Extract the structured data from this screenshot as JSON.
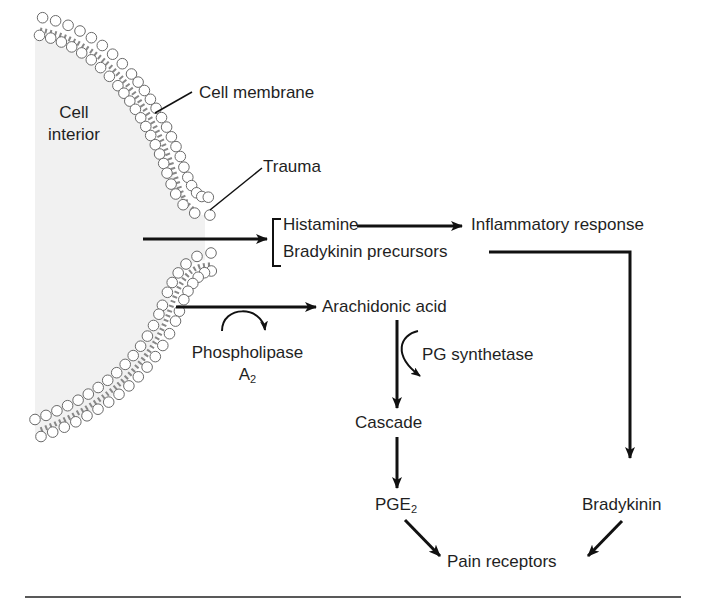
{
  "diagram": {
    "colors": {
      "line": "#111111",
      "membrane_stroke": "#6a6a6a",
      "cell_interior": "#f1f1f1",
      "background": "#ffffff"
    },
    "labels": {
      "cell_interior_line1": "Cell",
      "cell_interior_line2": "interior",
      "cell_membrane": "Cell membrane",
      "trauma": "Trauma",
      "histamine": "Histamine",
      "bradykinin_precursors": "Bradykinin precursors",
      "inflammatory_response": "Inflammatory response",
      "arachidonic_acid": "Arachidonic acid",
      "phospholipase": "Phospholipase",
      "phospholipase_a": "A",
      "phospholipase_sub": "2",
      "pg_synthetase": "PG synthetase",
      "cascade": "Cascade",
      "pge": "PGE",
      "pge_sub": "2",
      "bradykinin": "Bradykinin",
      "pain_receptors": "Pain receptors"
    },
    "nodes": [
      {
        "id": "cell_membrane",
        "label": "Cell membrane"
      },
      {
        "id": "trauma",
        "label": "Trauma"
      },
      {
        "id": "histamine",
        "label": "Histamine"
      },
      {
        "id": "bradykinin_precursors",
        "label": "Bradykinin precursors"
      },
      {
        "id": "inflammatory_response",
        "label": "Inflammatory response"
      },
      {
        "id": "arachidonic_acid",
        "label": "Arachidonic acid"
      },
      {
        "id": "cascade",
        "label": "Cascade"
      },
      {
        "id": "pge2",
        "label": "PGE2"
      },
      {
        "id": "bradykinin",
        "label": "Bradykinin"
      },
      {
        "id": "pain_receptors",
        "label": "Pain receptors"
      }
    ],
    "edges": [
      {
        "from": "trauma",
        "to": "histamine / bradykinin_precursors"
      },
      {
        "from": "histamine",
        "to": "inflammatory_response"
      },
      {
        "from": "bradykinin_precursors",
        "to": "bradykinin"
      },
      {
        "from": "cell_membrane",
        "to": "arachidonic_acid",
        "enzyme": "Phospholipase A2"
      },
      {
        "from": "arachidonic_acid",
        "to": "cascade",
        "enzyme": "PG synthetase"
      },
      {
        "from": "cascade",
        "to": "pge2"
      },
      {
        "from": "pge2",
        "to": "pain_receptors"
      },
      {
        "from": "bradykinin",
        "to": "pain_receptors"
      }
    ]
  }
}
